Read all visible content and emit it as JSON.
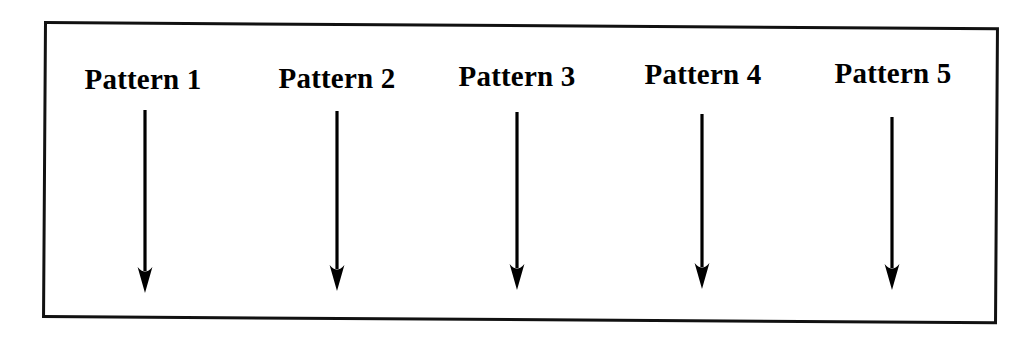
{
  "figure": {
    "type": "diagram",
    "frame": {
      "border_color": "#111111",
      "background_color": "#ffffff",
      "border_width_px": 3
    },
    "arrow": {
      "color": "#000000",
      "direction": "down",
      "icon": "down-arrow-icon"
    },
    "columns": [
      {
        "id": "pattern-1",
        "label": "Pattern 1",
        "label_left_px": 53,
        "label_top_px": 63,
        "arrow_x_px": 145,
        "arrow_top_px": 110,
        "arrow_bottom_px": 293
      },
      {
        "id": "pattern-2",
        "label": "Pattern 2",
        "label_left_px": 247,
        "label_top_px": 62,
        "arrow_x_px": 337,
        "arrow_top_px": 111,
        "arrow_bottom_px": 291
      },
      {
        "id": "pattern-3",
        "label": "Pattern 3",
        "label_left_px": 427,
        "label_top_px": 60,
        "arrow_x_px": 517,
        "arrow_top_px": 112,
        "arrow_bottom_px": 290
      },
      {
        "id": "pattern-4",
        "label": "Pattern 4",
        "label_left_px": 613,
        "label_top_px": 58,
        "arrow_x_px": 702,
        "arrow_top_px": 114,
        "arrow_bottom_px": 289
      },
      {
        "id": "pattern-5",
        "label": "Pattern 5",
        "label_left_px": 803,
        "label_top_px": 57,
        "arrow_x_px": 892,
        "arrow_top_px": 117,
        "arrow_bottom_px": 290
      }
    ]
  }
}
